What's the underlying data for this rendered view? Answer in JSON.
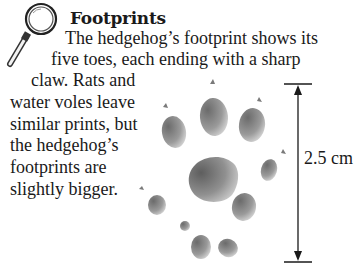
{
  "heading": {
    "icon": "magnifying-glass-icon",
    "title": "Footprints"
  },
  "body_lines": [
    "The hedgehog’s footprint shows its",
    "five toes, each ending with a sharp",
    "claw. Rats and",
    "water voles leave",
    "similar prints, but",
    "the hedgehog’s",
    "footprints are",
    "slightly bigger."
  ],
  "illustration": {
    "subject": "hedgehog-footprint",
    "measurement": "2.5 cm",
    "colors": {
      "print_dark": "#5a5a5a",
      "print_light": "#d8d8d8",
      "line": "#1a1a1a"
    }
  }
}
